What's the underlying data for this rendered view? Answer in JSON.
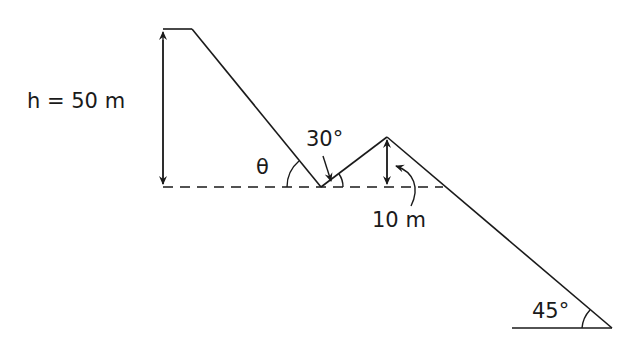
{
  "diagram": {
    "type": "physics-terrain-profile",
    "labels": {
      "height": "h = 50 m",
      "theta": "θ",
      "angle_30": "30°",
      "bump_height": "10 m",
      "angle_45": "45°"
    },
    "colors": {
      "stroke": "#1a1a1a",
      "background": "#ffffff"
    }
  }
}
